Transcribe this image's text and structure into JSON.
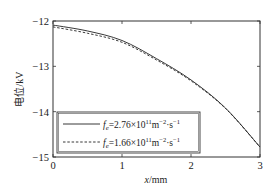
{
  "chart_data": {
    "type": "line",
    "title": "",
    "xlabel": "x/mm",
    "ylabel": "电位/kV",
    "xlim": [
      0,
      3
    ],
    "ylim": [
      -15,
      -12
    ],
    "xticks": [
      0,
      1,
      2,
      3
    ],
    "yticks": [
      -12,
      -13,
      -14,
      -15
    ],
    "xtick_labels": [
      "0",
      "1",
      "2",
      "3"
    ],
    "ytick_labels": [
      "−12",
      "−13",
      "−14",
      "−15"
    ],
    "grid": false,
    "legend_position": "lower left",
    "series": [
      {
        "name": "fe=2.76×10^11 m^-2·s^-1",
        "legend_label_main": "=2.76×10",
        "legend_exp": "11",
        "style": "solid",
        "color": "#222222",
        "x": [
          0,
          0.5,
          1.0,
          1.5,
          2.0,
          2.5,
          3.0
        ],
        "y": [
          -12.09,
          -12.22,
          -12.43,
          -12.83,
          -13.3,
          -13.92,
          -14.78
        ]
      },
      {
        "name": "fe=1.66×10^11 m^-2·s^-1",
        "legend_label_main": "=1.66×10",
        "legend_exp": "11",
        "style": "dashed",
        "color": "#222222",
        "x": [
          0,
          0.5,
          1.0,
          1.5,
          2.0,
          2.5,
          3.0
        ],
        "y": [
          -12.13,
          -12.27,
          -12.47,
          -12.86,
          -13.32,
          -13.93,
          -14.78
        ]
      }
    ]
  },
  "labels": {
    "legend_f": "f",
    "legend_sub": "e",
    "legend_unit_m": "m",
    "legend_unit_m_exp": "−2",
    "legend_unit_s": "·s",
    "legend_unit_s_exp": "−1",
    "x_var": "x",
    "x_unit": "/mm",
    "y_label": "电位/kV"
  }
}
